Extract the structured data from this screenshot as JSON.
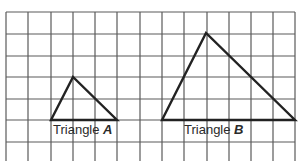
{
  "diagram": {
    "type": "grid-with-triangles",
    "grid": {
      "columns_x": [
        6,
        28,
        51,
        73,
        95,
        117,
        140,
        162,
        184,
        207,
        229,
        251,
        273,
        295
      ],
      "rows_y": [
        12,
        34,
        56,
        77,
        99,
        120,
        142
      ],
      "top": 12,
      "bottom": 161,
      "left": 6,
      "right": 295,
      "line_color": "#5a5a5a"
    },
    "triangles": [
      {
        "name": "Triangle A",
        "label_prefix": "Triangle ",
        "label_letter": "A",
        "points": [
          [
            51,
            120
          ],
          [
            117,
            120
          ],
          [
            73,
            77
          ]
        ],
        "label_pos": [
          53,
          122
        ]
      },
      {
        "name": "Triangle B",
        "label_prefix": "Triangle ",
        "label_letter": "B",
        "points": [
          [
            162,
            120
          ],
          [
            295,
            120
          ],
          [
            206,
            33
          ]
        ],
        "label_pos": [
          184,
          122
        ]
      }
    ],
    "stroke_color": "#222222"
  }
}
